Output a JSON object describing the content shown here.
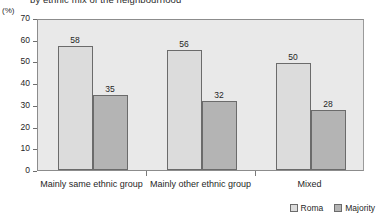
{
  "chart_data": {
    "type": "bar",
    "title": "by ethnic mix of the neighbourhood",
    "unit_label": "(%)",
    "xlabel": "",
    "ylabel": "",
    "ylim": [
      0,
      70
    ],
    "ytick_step": 10,
    "yticks": [
      70,
      60,
      50,
      40,
      30,
      20,
      10,
      0
    ],
    "grid": false,
    "legend_position": "bottom-right",
    "categories": [
      "Mainly same ethnic group",
      "Mainly other ethnic group",
      "Mixed"
    ],
    "series": [
      {
        "name": "Roma",
        "color": "#dcdcdc",
        "values": [
          58,
          56,
          50
        ]
      },
      {
        "name": "Majority",
        "color": "#b4b4b4",
        "values": [
          35,
          32,
          28
        ]
      }
    ]
  },
  "legend": {
    "items": [
      {
        "label": "Roma"
      },
      {
        "label": "Majority"
      }
    ]
  }
}
